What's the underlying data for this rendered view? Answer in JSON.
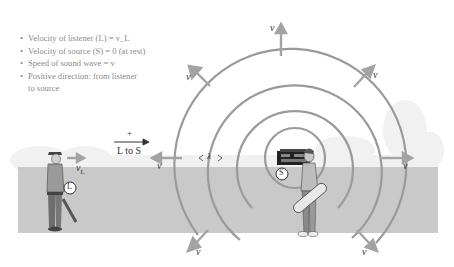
{
  "legend": {
    "items": [
      "Velocity of listener (L) = v_L",
      "Velocity of source (S) = 0 (at rest)",
      "Speed of sound wave = v",
      "Positive direction: from listener",
      "to source"
    ]
  },
  "labels": {
    "positive_sign": "+",
    "direction": "L to S",
    "listener_velocity": "v",
    "listener_velocity_sub": "L",
    "listener_marker": "L",
    "source_marker": "S",
    "wavelength": "λ",
    "wave_speed": "v"
  },
  "wave_arrows": [
    "v",
    "v",
    "v",
    "v",
    "v",
    "v",
    "v",
    "v"
  ],
  "colors": {
    "ground": "#c9c9c9",
    "sky_haze": "#efefef",
    "wavefront": "#9a9a9a",
    "arrow": "#a3a3a3",
    "text": "#333333",
    "legend_text": "#8a8a8a"
  }
}
